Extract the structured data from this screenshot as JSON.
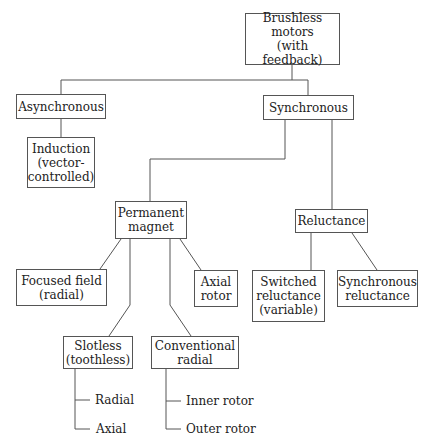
{
  "diagram": {
    "root": "Brushless\nmotors\n(with feedback)",
    "asynchronous": "Asynchronous",
    "induction": "Induction\n(vector-\ncontrolled)",
    "synchronous": "Synchronous",
    "permanent_magnet": "Permanent\nmagnet",
    "reluctance": "Reluctance",
    "focused_field": "Focused field\n(radial)",
    "axial_rotor": "Axial\nrotor",
    "switched_reluctance": "Switched\nreluctance\n(variable)",
    "synchronous_reluctance": "Synchronous\nreluctance",
    "slotless": "Slotless\n(toothless)",
    "conventional_radial": "Conventional\nradial",
    "slotless_children": [
      "Radial",
      "Axial"
    ],
    "conventional_children": [
      "Inner rotor",
      "Outer rotor"
    ]
  },
  "colors": {
    "line": "#555555",
    "text": "#222222",
    "background": "#ffffff"
  }
}
